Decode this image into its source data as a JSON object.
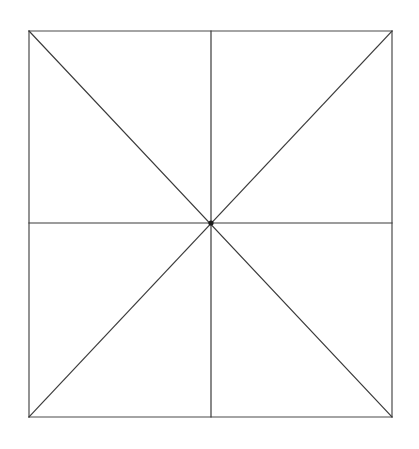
{
  "figure": {
    "canvas": {
      "width": 419,
      "height": 449,
      "background_color": "#ffffff"
    },
    "style": {
      "line_color": "#3a3a3a",
      "frame_color": "#4a4a4a",
      "center_dot_color": "#1a1a1a",
      "line_width": 1.2,
      "frame_width": 1.2,
      "center_dot_radius": 2.6
    },
    "square": {
      "label": "outer-square",
      "left": 29,
      "top": 31,
      "right": 392,
      "bottom": 417,
      "width": 363,
      "height": 386
    },
    "center_point": {
      "label": "center",
      "x": 211,
      "y": 223
    },
    "frame_edges": [
      {
        "name": "top-edge",
        "x1": 29,
        "y1": 31,
        "x2": 392,
        "y2": 31
      },
      {
        "name": "right-edge",
        "x1": 392,
        "y1": 31,
        "x2": 392,
        "y2": 417
      },
      {
        "name": "bottom-edge",
        "x1": 29,
        "y1": 417,
        "x2": 392,
        "y2": 417
      },
      {
        "name": "left-edge",
        "x1": 29,
        "y1": 31,
        "x2": 29,
        "y2": 417
      }
    ],
    "interior_lines": [
      {
        "name": "vertical-median",
        "x1": 211,
        "y1": 31,
        "x2": 211,
        "y2": 417
      },
      {
        "name": "horizontal-median",
        "x1": 29,
        "y1": 223,
        "x2": 392,
        "y2": 223
      },
      {
        "name": "diagonal-tl-br",
        "x1": 29,
        "y1": 31,
        "x2": 392,
        "y2": 417
      },
      {
        "name": "diagonal-tr-bl",
        "x1": 392,
        "y1": 31,
        "x2": 29,
        "y2": 417
      }
    ],
    "sector_count": 8,
    "vertices": {
      "top_left": {
        "x": 29,
        "y": 31
      },
      "top_mid": {
        "x": 211,
        "y": 31
      },
      "top_right": {
        "x": 392,
        "y": 31
      },
      "mid_right": {
        "x": 392,
        "y": 223
      },
      "bottom_right": {
        "x": 392,
        "y": 417
      },
      "bottom_mid": {
        "x": 211,
        "y": 417
      },
      "bottom_left": {
        "x": 29,
        "y": 417
      },
      "mid_left": {
        "x": 29,
        "y": 223
      }
    }
  }
}
